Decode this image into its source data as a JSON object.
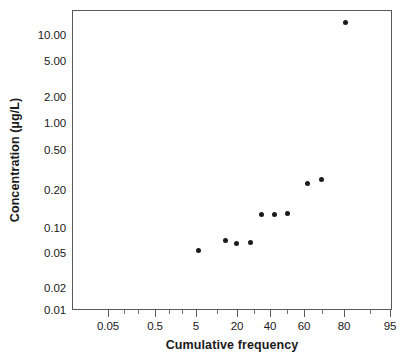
{
  "chart_data": {
    "type": "scatter",
    "title": "",
    "xlabel": "Cumulative frequency",
    "ylabel": "Concentration (µg/L)",
    "xscale": "probability",
    "yscale": "log",
    "xlim": [
      0.02,
      98
    ],
    "ylim": [
      0.01,
      13
    ],
    "grid": false,
    "legend": null,
    "x_tick_labels": [
      "0.05",
      "0.5",
      "5",
      "20",
      "40",
      "60",
      "80",
      "95"
    ],
    "x_tick_values": [
      0.05,
      0.5,
      5,
      20,
      40,
      60,
      80,
      95
    ],
    "y_tick_labels": [
      "10.00",
      "5.00",
      "2.00",
      "1.00",
      "0.50",
      "0.20",
      "0.10",
      "0.05",
      "0.02",
      "0.01"
    ],
    "y_tick_values": [
      10.0,
      5.0,
      2.0,
      1.0,
      0.5,
      0.2,
      0.1,
      0.05,
      0.02,
      0.01
    ],
    "series": [
      {
        "name": "Concentration",
        "marker": "filled-circle",
        "color": "#1b1b1b",
        "points": [
          {
            "x": 9,
            "y": 0.043
          },
          {
            "x": 19,
            "y": 0.054
          },
          {
            "x": 25,
            "y": 0.05
          },
          {
            "x": 33,
            "y": 0.052
          },
          {
            "x": 40,
            "y": 0.101
          },
          {
            "x": 49,
            "y": 0.1
          },
          {
            "x": 58,
            "y": 0.103
          },
          {
            "x": 71,
            "y": 0.21
          },
          {
            "x": 79,
            "y": 0.23
          },
          {
            "x": 89,
            "y": 10.0
          }
        ]
      }
    ]
  },
  "axes": {
    "frame_color": "#5a5a5a",
    "tick_color": "#5a5a5a",
    "x_minor_ticks": [
      0.1,
      0.2,
      1,
      2,
      10,
      30,
      50,
      70,
      90
    ],
    "y_minor_ticks": [
      0.03,
      0.3,
      3
    ]
  }
}
